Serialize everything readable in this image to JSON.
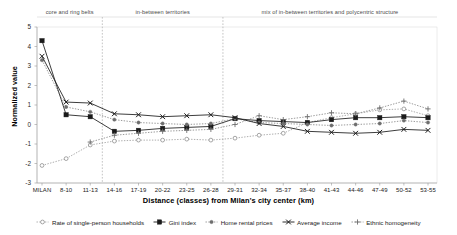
{
  "chart_data": {
    "type": "line",
    "title": "",
    "xlabel": "Distance (classes) from Milan's city center (km)",
    "ylabel": "Normalized value",
    "ylim": [
      -3,
      5
    ],
    "yticks": [
      5,
      4,
      3,
      2,
      1,
      0,
      -1,
      -2,
      -3
    ],
    "grid": false,
    "legend_position": "bottom",
    "categories": [
      "MILAN",
      "8-10",
      "11-13",
      "14-16",
      "17-19",
      "20-22",
      "23-25",
      "26-28",
      "29-31",
      "32-34",
      "35-37",
      "38-40",
      "41-43",
      "44-46",
      "47-49",
      "50-52",
      "53-55"
    ],
    "band_labels": [
      "core and ring belts",
      "in-between territories",
      "mix of in-between territories and polycentric structure"
    ],
    "series": [
      {
        "name": "Rate of single-person households",
        "marker": "open-circle",
        "line": "dotted",
        "color": "#8a8a8a",
        "values": [
          -2.1,
          -1.75,
          -1.05,
          -0.85,
          -0.8,
          -0.8,
          -0.75,
          -0.8,
          -0.7,
          -0.55,
          -0.45,
          0.1,
          0.35,
          0.55,
          0.75,
          0.8,
          0.45
        ]
      },
      {
        "name": "Gini index",
        "marker": "filled-square",
        "line": "solid",
        "color": "#1a1a1a",
        "values": [
          4.3,
          0.5,
          0.4,
          -0.35,
          -0.3,
          -0.2,
          -0.15,
          -0.1,
          0.3,
          0.2,
          0.15,
          0.1,
          0.25,
          0.35,
          0.35,
          0.4,
          0.35
        ]
      },
      {
        "name": "Home rental prices",
        "marker": "small-filled-circle",
        "line": "dotted",
        "color": "#6e6e6e",
        "values": [
          3.3,
          0.9,
          0.65,
          0.25,
          0.1,
          0.05,
          0.0,
          0.05,
          0.3,
          0.1,
          0.05,
          0.0,
          -0.05,
          0.0,
          0.05,
          0.2,
          0.1
        ]
      },
      {
        "name": "Average income",
        "marker": "cross-x",
        "line": "solid",
        "color": "#1a1a1a",
        "values": [
          3.5,
          1.15,
          1.1,
          0.55,
          0.5,
          0.4,
          0.45,
          0.5,
          0.35,
          0.05,
          -0.1,
          -0.35,
          -0.4,
          -0.45,
          -0.4,
          -0.25,
          -0.3
        ]
      },
      {
        "name": "Ethnic homogeneity",
        "marker": "plus",
        "line": "dotted",
        "color": "#6e6e6e",
        "values": [
          null,
          null,
          -0.9,
          -0.55,
          -0.45,
          -0.35,
          -0.3,
          -0.25,
          0.0,
          0.45,
          0.25,
          0.4,
          0.6,
          0.55,
          0.85,
          1.2,
          0.8
        ]
      }
    ]
  }
}
